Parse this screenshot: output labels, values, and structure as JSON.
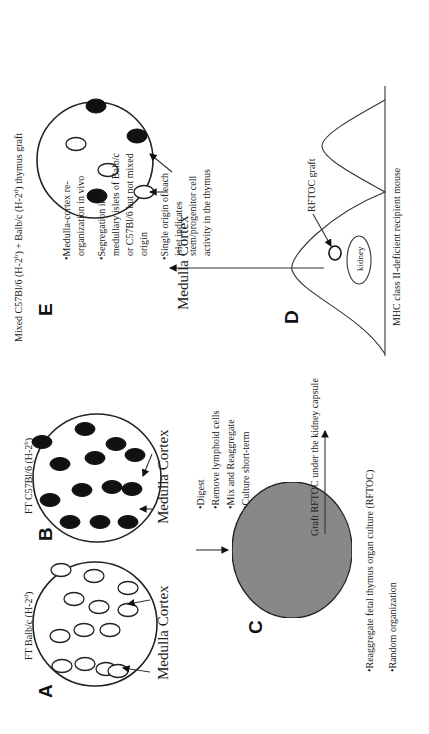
{
  "figure": {
    "orientation": "rotated 90 degrees counter-clockwise",
    "panels": {
      "A": {
        "letter": "A",
        "title": "FT Balb/c (H-2",
        "title_sup": "d",
        "title_end": ")",
        "label_medulla": "Medulla",
        "label_cortex": "Cortex",
        "islet_type": "open"
      },
      "B": {
        "letter": "B",
        "title": "FT C57Bl/6 (H-2",
        "title_sup": "b",
        "title_end": ")",
        "label_medulla": "Medulla",
        "label_cortex": "Cortex",
        "islet_type": "filled"
      },
      "C": {
        "letter": "C",
        "steps": [
          "•Digest",
          "•Remove lymphoid cells",
          "•Mix and Reaggregate",
          "•Culture short-term"
        ],
        "notes": [
          "•Reaggregate fetal thymus organ culture (RFTOC)",
          "•Random organization"
        ],
        "fill_color": "#8c8c8c"
      },
      "D": {
        "letter": "D",
        "graft_label": "Graft RFTOC under the kidney capsule",
        "rftoc_label": "RFTOC graft",
        "kidney_label": "kidney",
        "mouse_label": "MHC class II-deficient recipient mouse"
      },
      "E": {
        "letter": "E",
        "title_part1": "Mixed C57Bl/6 (H-2",
        "title_sup1": "b",
        "title_part2": ") + Balb/c (H-2",
        "title_sup2": "d",
        "title_part3": ") thymus graft",
        "label_medulla": "Medulla",
        "label_cortex": "Cortex",
        "bullets": [
          [
            "•Medulla-cortex re-",
            "organization in vivo"
          ],
          [
            "•Segregation into",
            "medullary islets of Balb/c",
            "or C57Bl/6 but not mixed",
            "origin"
          ],
          [
            "•Single origin of each",
            "islet indicates",
            "stem/progenitor cell",
            "activity in the thymus"
          ]
        ]
      }
    }
  }
}
